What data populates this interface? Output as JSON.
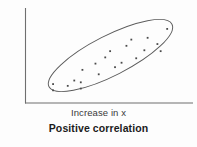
{
  "figure": {
    "caption": "Positive correlation",
    "x_axis_label": "Increase in x",
    "y_axis_label": "Increase in y",
    "background_color": "#fdfdfd",
    "axis_color": "#6f6f6f",
    "ellipse_color": "#5b5b5b",
    "point_color": "#4a4a4a"
  },
  "chart_data": {
    "type": "scatter",
    "title": "Positive correlation",
    "xlabel": "Increase in x",
    "ylabel": "Increase in y",
    "xlim": [
      0,
      100
    ],
    "ylim": [
      0,
      100
    ],
    "grid": false,
    "legend": "none",
    "axis_ticks": {
      "x": [],
      "y": []
    },
    "annotations": [
      {
        "type": "ellipse",
        "label": "correlation-envelope",
        "center_x": 46,
        "center_y": 50,
        "semi_major": 48,
        "semi_minor": 14,
        "rotation_deg": -27,
        "filled": false
      }
    ],
    "points": [
      {
        "x": 16,
        "y": 19
      },
      {
        "x": 16,
        "y": 12
      },
      {
        "x": 25,
        "y": 17
      },
      {
        "x": 29,
        "y": 23
      },
      {
        "x": 33,
        "y": 21
      },
      {
        "x": 33,
        "y": 14
      },
      {
        "x": 34,
        "y": 35
      },
      {
        "x": 42,
        "y": 42
      },
      {
        "x": 44,
        "y": 30
      },
      {
        "x": 48,
        "y": 49
      },
      {
        "x": 51,
        "y": 56
      },
      {
        "x": 54,
        "y": 38
      },
      {
        "x": 58,
        "y": 43
      },
      {
        "x": 61,
        "y": 62
      },
      {
        "x": 64,
        "y": 69
      },
      {
        "x": 67,
        "y": 48
      },
      {
        "x": 72,
        "y": 57
      },
      {
        "x": 74,
        "y": 71
      },
      {
        "x": 80,
        "y": 64
      },
      {
        "x": 82,
        "y": 56
      },
      {
        "x": 86,
        "y": 81
      }
    ],
    "correlation_direction": "positive"
  }
}
